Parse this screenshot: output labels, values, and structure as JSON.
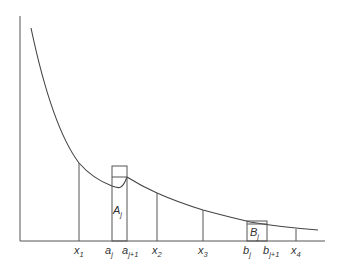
{
  "diagram": {
    "colors": {
      "line": "#555555",
      "curve": "#444444",
      "background": "#ffffff",
      "text": "#333333"
    },
    "axes": {
      "y_axis": {
        "x": 20,
        "y_top": 16,
        "y_bottom": 241
      },
      "x_axis": {
        "y": 241,
        "x_left": 20,
        "x_right": 325
      }
    },
    "curve": {
      "path": "M31,28 C45,95 62,140 79,163 C95,181 112,170 127,178 C140,185 150,190 157,193 C175,201 190,206 203,210 C225,216 240,220 250,222 C270,225 290,228 318,230"
    },
    "verticals": [
      {
        "id": "x1",
        "x": 79,
        "top": 163
      },
      {
        "id": "aj",
        "x": 112,
        "top": 166
      },
      {
        "id": "aj1",
        "x": 127,
        "top": 166
      },
      {
        "id": "x2",
        "x": 157,
        "top": 193
      },
      {
        "id": "x3",
        "x": 203,
        "top": 210
      },
      {
        "id": "bj",
        "x": 247,
        "top": 222
      },
      {
        "id": "bj1",
        "x": 267,
        "top": 222
      },
      {
        "id": "x4",
        "x": 296,
        "top": 229
      }
    ],
    "rectangles": [
      {
        "id": "A",
        "x": 112,
        "y": 166,
        "w": 15,
        "h": 75,
        "inner_line_y": 177
      },
      {
        "id": "B",
        "x": 247,
        "y": 221,
        "w": 20,
        "h": 20,
        "inner_line_y": 224
      }
    ],
    "labels": {
      "x1": {
        "base": "x",
        "sub": "1"
      },
      "aj": {
        "base": "a",
        "sub": "j"
      },
      "aj1": {
        "base": "a",
        "sub": "j+1"
      },
      "x2": {
        "base": "x",
        "sub": "2"
      },
      "x3": {
        "base": "x",
        "sub": "3"
      },
      "bj": {
        "base": "b",
        "sub": "j"
      },
      "bj1": {
        "base": "b",
        "sub": "j+1"
      },
      "x4": {
        "base": "x",
        "sub": "4"
      },
      "A": {
        "base": "A",
        "sub": "j"
      },
      "B": {
        "base": "B",
        "sub": "j"
      }
    }
  }
}
